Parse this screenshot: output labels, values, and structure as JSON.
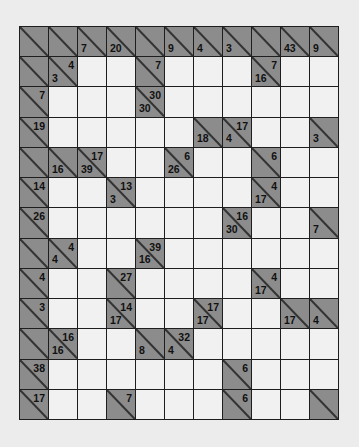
{
  "puzzle": {
    "type": "kakuro",
    "columns": 11,
    "rows_count": 13,
    "colors": {
      "block": "#8c8c8c",
      "white": "#f1f1f1",
      "grid_line": "#1e1e1e",
      "background": "#ececec"
    },
    "legend": "Cell codes: W = white entry cell; B = block cell; B:r=across-sum,d=down-sum",
    "rows": [
      [
        {
          "t": "B"
        },
        {
          "t": "B"
        },
        {
          "t": "B",
          "d": "7"
        },
        {
          "t": "B",
          "d": "20"
        },
        {
          "t": "B"
        },
        {
          "t": "B",
          "d": "9"
        },
        {
          "t": "B",
          "d": "4"
        },
        {
          "t": "B",
          "d": "3"
        },
        {
          "t": "B"
        },
        {
          "t": "B",
          "d": "43"
        },
        {
          "t": "B",
          "d": "9"
        }
      ],
      [
        {
          "t": "B"
        },
        {
          "t": "B",
          "r": "4",
          "d": "3"
        },
        {
          "t": "W"
        },
        {
          "t": "W"
        },
        {
          "t": "B",
          "r": "7"
        },
        {
          "t": "W"
        },
        {
          "t": "W"
        },
        {
          "t": "W"
        },
        {
          "t": "B",
          "r": "7",
          "d": "16"
        },
        {
          "t": "W"
        },
        {
          "t": "W"
        }
      ],
      [
        {
          "t": "B",
          "r": "7"
        },
        {
          "t": "W"
        },
        {
          "t": "W"
        },
        {
          "t": "W"
        },
        {
          "t": "B",
          "r": "30",
          "d": "30"
        },
        {
          "t": "W"
        },
        {
          "t": "W"
        },
        {
          "t": "W"
        },
        {
          "t": "W"
        },
        {
          "t": "W"
        },
        {
          "t": "W"
        }
      ],
      [
        {
          "t": "B",
          "r": "19"
        },
        {
          "t": "W"
        },
        {
          "t": "W"
        },
        {
          "t": "W"
        },
        {
          "t": "W"
        },
        {
          "t": "W"
        },
        {
          "t": "B",
          "d": "18"
        },
        {
          "t": "B",
          "r": "17",
          "d": "4"
        },
        {
          "t": "W"
        },
        {
          "t": "W"
        },
        {
          "t": "B",
          "d": "3"
        }
      ],
      [
        {
          "t": "B"
        },
        {
          "t": "B",
          "d": "16"
        },
        {
          "t": "B",
          "r": "17",
          "d": "39"
        },
        {
          "t": "W"
        },
        {
          "t": "W"
        },
        {
          "t": "B",
          "r": "6",
          "d": "26"
        },
        {
          "t": "W"
        },
        {
          "t": "W"
        },
        {
          "t": "B",
          "r": "6"
        },
        {
          "t": "W"
        },
        {
          "t": "W"
        }
      ],
      [
        {
          "t": "B",
          "r": "14"
        },
        {
          "t": "W"
        },
        {
          "t": "W"
        },
        {
          "t": "B",
          "r": "13",
          "d": "3"
        },
        {
          "t": "W"
        },
        {
          "t": "W"
        },
        {
          "t": "W"
        },
        {
          "t": "W"
        },
        {
          "t": "B",
          "r": "4",
          "d": "17"
        },
        {
          "t": "W"
        },
        {
          "t": "W"
        }
      ],
      [
        {
          "t": "B",
          "r": "26"
        },
        {
          "t": "W"
        },
        {
          "t": "W"
        },
        {
          "t": "W"
        },
        {
          "t": "W"
        },
        {
          "t": "W"
        },
        {
          "t": "W"
        },
        {
          "t": "B",
          "r": "16",
          "d": "30"
        },
        {
          "t": "W"
        },
        {
          "t": "W"
        },
        {
          "t": "B",
          "d": "7"
        }
      ],
      [
        {
          "t": "B"
        },
        {
          "t": "B",
          "r": "4",
          "d": "4"
        },
        {
          "t": "W"
        },
        {
          "t": "W"
        },
        {
          "t": "B",
          "r": "39",
          "d": "16"
        },
        {
          "t": "W"
        },
        {
          "t": "W"
        },
        {
          "t": "W"
        },
        {
          "t": "W"
        },
        {
          "t": "W"
        },
        {
          "t": "W"
        }
      ],
      [
        {
          "t": "B",
          "r": "4"
        },
        {
          "t": "W"
        },
        {
          "t": "W"
        },
        {
          "t": "B",
          "r": "27"
        },
        {
          "t": "W"
        },
        {
          "t": "W"
        },
        {
          "t": "W"
        },
        {
          "t": "W"
        },
        {
          "t": "B",
          "r": "4",
          "d": "17"
        },
        {
          "t": "W"
        },
        {
          "t": "W"
        }
      ],
      [
        {
          "t": "B",
          "r": "3"
        },
        {
          "t": "W"
        },
        {
          "t": "W"
        },
        {
          "t": "B",
          "r": "14",
          "d": "17"
        },
        {
          "t": "W"
        },
        {
          "t": "W"
        },
        {
          "t": "B",
          "r": "17",
          "d": "17"
        },
        {
          "t": "W"
        },
        {
          "t": "W"
        },
        {
          "t": "B",
          "d": "17"
        },
        {
          "t": "B",
          "d": "4"
        }
      ],
      [
        {
          "t": "B"
        },
        {
          "t": "B",
          "r": "16",
          "d": "16"
        },
        {
          "t": "W"
        },
        {
          "t": "W"
        },
        {
          "t": "B",
          "d": "8"
        },
        {
          "t": "B",
          "r": "32",
          "d": "4"
        },
        {
          "t": "W"
        },
        {
          "t": "W"
        },
        {
          "t": "W"
        },
        {
          "t": "W"
        },
        {
          "t": "W"
        }
      ],
      [
        {
          "t": "B",
          "r": "38"
        },
        {
          "t": "W"
        },
        {
          "t": "W"
        },
        {
          "t": "W"
        },
        {
          "t": "W"
        },
        {
          "t": "W"
        },
        {
          "t": "W"
        },
        {
          "t": "B",
          "r": "6"
        },
        {
          "t": "W"
        },
        {
          "t": "W"
        },
        {
          "t": "W"
        }
      ],
      [
        {
          "t": "B",
          "r": "17"
        },
        {
          "t": "W"
        },
        {
          "t": "W"
        },
        {
          "t": "B",
          "r": "7"
        },
        {
          "t": "W"
        },
        {
          "t": "W"
        },
        {
          "t": "W"
        },
        {
          "t": "B",
          "r": "6"
        },
        {
          "t": "W"
        },
        {
          "t": "W"
        },
        {
          "t": "B"
        }
      ]
    ]
  }
}
